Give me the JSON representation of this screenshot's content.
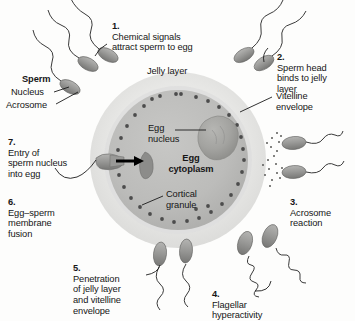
{
  "figure": {
    "colors": {
      "jelly_layer": "#e9e9e7",
      "vitelline_envelope": "#d8d8d6",
      "egg_cytoplasm": "#b9b9b7",
      "egg_nucleus": "#a2a2a0",
      "cortical_granule": "#4a4a4a",
      "sperm_body": "#8f8f8d",
      "text": "#161616",
      "background": "#fdfdfc",
      "arrow": "#000000"
    }
  },
  "steps": [
    {
      "id": "step-1",
      "number": "1.",
      "text": "Chemical signals\nattract sperm to egg"
    },
    {
      "id": "step-2",
      "number": "2.",
      "text": "Sperm head\nbinds to jelly\nlayer"
    },
    {
      "id": "step-3",
      "number": "3.",
      "text": "Acrosome\nreaction"
    },
    {
      "id": "step-4",
      "number": "4.",
      "text": "Flagellar\nhyperactivity"
    },
    {
      "id": "step-5",
      "number": "5.",
      "text": "Penetration\nof jelly layer\nand vitelline\nenvelope"
    },
    {
      "id": "step-6",
      "number": "6.",
      "text": "Egg–sperm\nmembrane\nfusion"
    },
    {
      "id": "step-7",
      "number": "7.",
      "text": "Entry of\nsperm nucleus\ninto egg"
    }
  ],
  "labels": {
    "sperm": "Sperm",
    "nucleus": "Nucleus",
    "acrosome": "Acrosome",
    "jelly_layer": "Jelly layer",
    "vitelline_envelope": "Vitelline\nenvelope",
    "egg_nucleus": "Egg\nnucleus",
    "egg_cytoplasm": "Egg\ncytoplasm",
    "cortical_granule": "Cortical\ngranule"
  },
  "structures": {
    "egg": "egg-cell",
    "sperm_count_top_left": 3,
    "sperm_count_top_right": 2,
    "sperm_count_right": 2,
    "sperm_count_bottom": 2,
    "sperm_count_bottom_right": 2,
    "fusing_sperm": 1,
    "sperm_nucleus_inside": 1
  }
}
